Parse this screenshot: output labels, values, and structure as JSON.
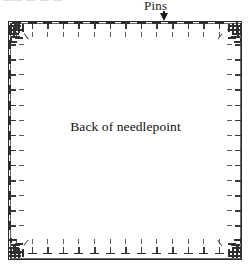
{
  "figure": {
    "type": "diagram",
    "caption_remnant": "——  —  — —",
    "annotations": {
      "pins_label": "Pins",
      "pins_arrow_icon": "arrow-down-icon",
      "center_label": "Back of needlepoint"
    },
    "colors": {
      "ink": "#1b1b1b",
      "frame": "#2b2b2b",
      "pin": "#3a3a3a",
      "pin_tail": "#5e5e5e",
      "background": "#ffffff"
    },
    "canvas": {
      "x": 8,
      "y": 21,
      "width": 234,
      "height": 239
    },
    "pins": {
      "top": {
        "count": 14,
        "start_x": 12,
        "spacing": 15.6,
        "y": 22
      },
      "bottom": {
        "count": 14,
        "start_x": 12,
        "spacing": 15.6,
        "y": 238
      },
      "left": {
        "count": 14,
        "start_y": 25,
        "spacing": 15.1,
        "x": 9
      },
      "right": {
        "count": 14,
        "start_y": 25,
        "spacing": 15.1,
        "x": 226
      }
    },
    "corner_clusters": [
      {
        "name": "top-left"
      },
      {
        "name": "top-right"
      },
      {
        "name": "bottom-left"
      },
      {
        "name": "bottom-right"
      }
    ]
  }
}
